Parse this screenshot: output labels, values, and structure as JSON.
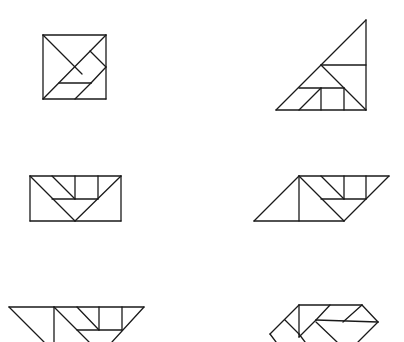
{
  "diagram": {
    "title": "",
    "stroke_color": "#1a1a1a",
    "background": "#ffffff",
    "figures": [
      {
        "name": "tangram-square",
        "segments": [
          [
            43,
            35,
            106,
            35
          ],
          [
            106,
            35,
            106,
            99
          ],
          [
            106,
            99,
            43,
            99
          ],
          [
            43,
            99,
            43,
            35
          ],
          [
            43,
            35,
            82,
            74
          ],
          [
            106,
            35,
            43,
            99
          ],
          [
            90,
            51,
            106,
            67
          ],
          [
            106,
            67,
            91,
            83
          ],
          [
            59,
            83,
            91,
            83
          ],
          [
            91,
            83,
            75,
            99
          ]
        ]
      },
      {
        "name": "tangram-large-triangle",
        "segments": [
          [
            276,
            110,
            366,
            110
          ],
          [
            366,
            110,
            366,
            20
          ],
          [
            366,
            20,
            276,
            110
          ],
          [
            321,
            65,
            366,
            65
          ],
          [
            321,
            65,
            366,
            110
          ],
          [
            299,
            88,
            344,
            88
          ],
          [
            321,
            88,
            321,
            110
          ],
          [
            344,
            88,
            344,
            110
          ],
          [
            321,
            88,
            299,
            110
          ]
        ]
      },
      {
        "name": "tangram-rectangle",
        "segments": [
          [
            30,
            176,
            121,
            176
          ],
          [
            121,
            176,
            121,
            221
          ],
          [
            121,
            221,
            30,
            221
          ],
          [
            30,
            221,
            30,
            176
          ],
          [
            30,
            176,
            75,
            221
          ],
          [
            121,
            176,
            75,
            221
          ],
          [
            52,
            199,
            98,
            199
          ],
          [
            52,
            176,
            75,
            199
          ],
          [
            75,
            176,
            75,
            199
          ],
          [
            98,
            176,
            98,
            199
          ]
        ]
      },
      {
        "name": "tangram-parallelogram",
        "segments": [
          [
            254,
            221,
            344,
            221
          ],
          [
            344,
            221,
            389,
            176
          ],
          [
            389,
            176,
            299,
            176
          ],
          [
            299,
            176,
            254,
            221
          ],
          [
            299,
            176,
            299,
            221
          ],
          [
            299,
            176,
            344,
            221
          ],
          [
            321,
            199,
            366,
            199
          ],
          [
            321,
            176,
            344,
            199
          ],
          [
            344,
            176,
            344,
            199
          ],
          [
            366,
            176,
            366,
            199
          ]
        ]
      },
      {
        "name": "tangram-trapezoid-partial",
        "segments": [
          [
            9,
            307,
            144,
            307
          ],
          [
            9,
            307,
            44,
            342
          ],
          [
            54,
            307,
            54,
            342
          ],
          [
            54,
            307,
            89,
            342
          ],
          [
            77,
            307,
            99,
            330
          ],
          [
            99,
            307,
            99,
            330
          ],
          [
            122,
            307,
            122,
            330
          ],
          [
            77,
            330,
            122,
            330
          ],
          [
            144,
            307,
            112,
            342
          ]
        ]
      },
      {
        "name": "tangram-shape-partial",
        "segments": [
          [
            299,
            305,
            362,
            305
          ],
          [
            299,
            305,
            299,
            337
          ],
          [
            299,
            305,
            270,
            334
          ],
          [
            270,
            334,
            276,
            342
          ],
          [
            285,
            320,
            299,
            334
          ],
          [
            299,
            334,
            305,
            342
          ],
          [
            299,
            337,
            316,
            320
          ],
          [
            316,
            320,
            378,
            322
          ],
          [
            330,
            305,
            316,
            320
          ],
          [
            362,
            305,
            343,
            322
          ],
          [
            362,
            305,
            378,
            322
          ],
          [
            316,
            322,
            337,
            342
          ],
          [
            378,
            322,
            358,
            342
          ]
        ]
      }
    ]
  }
}
